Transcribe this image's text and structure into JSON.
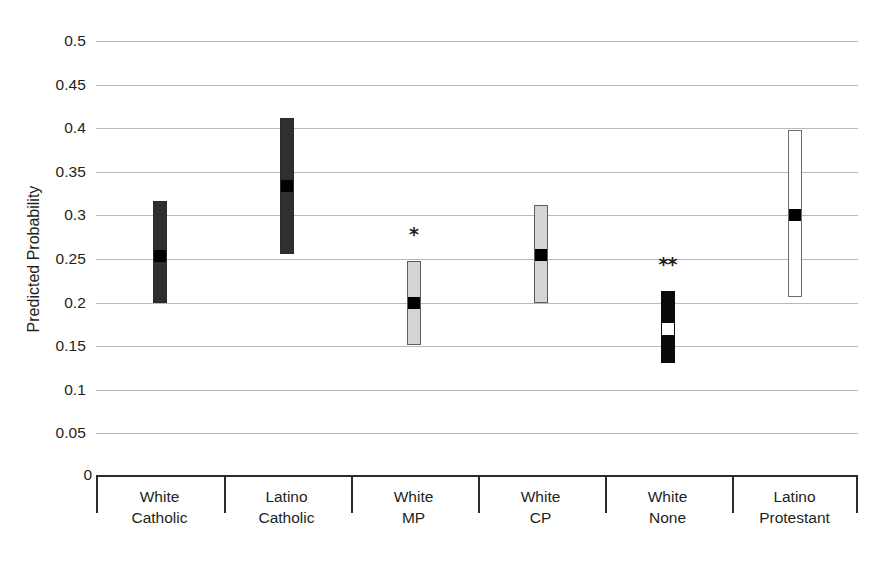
{
  "chart_data": {
    "type": "bar",
    "title": "",
    "xlabel": "",
    "ylabel": "Predicted Probability",
    "ylim": [
      0,
      0.5
    ],
    "ytick_values": [
      0.5,
      0.45,
      0.4,
      0.35,
      0.3,
      0.25,
      0.2,
      0.15,
      0.1,
      0.05,
      0
    ],
    "ytick_labels": [
      "0.5",
      "0.45",
      "0.4",
      "0.35",
      "0.3",
      "0.25",
      "0.2",
      "0.15",
      "0.1",
      "0.05",
      "0"
    ],
    "grid": true,
    "legend_position": "none",
    "categories": [
      "White Catholic",
      "Latino Catholic",
      "White MP",
      "White CP",
      "White None",
      "Latino Protestant"
    ],
    "category_labels": [
      [
        "White",
        "Catholic"
      ],
      [
        "Latino",
        "Catholic"
      ],
      [
        "White",
        "MP"
      ],
      [
        "White",
        "CP"
      ],
      [
        "White",
        "None"
      ],
      [
        "Latino",
        "Protestant"
      ]
    ],
    "series": [
      {
        "name": "Predicted probability (point estimate)",
        "values": [
          0.254,
          0.334,
          0.2,
          0.255,
          0.17,
          0.301
        ]
      },
      {
        "name": "Confidence interval lower bound",
        "values": [
          0.199,
          0.256,
          0.151,
          0.2,
          0.131,
          0.206
        ]
      },
      {
        "name": "Confidence interval upper bound",
        "values": [
          0.316,
          0.412,
          0.248,
          0.312,
          0.213,
          0.398
        ]
      }
    ],
    "bar_styles": [
      "fill-darkgray",
      "fill-darkgray",
      "fill-lightgray",
      "fill-lightgray",
      "fill-black",
      "fill-white"
    ],
    "marker_styles": [
      "marker-black",
      "marker-black",
      "marker-black",
      "marker-black",
      "marker-white",
      "marker-black"
    ],
    "annotations": [
      {
        "category": "White MP",
        "text": "*",
        "value": 0.278
      },
      {
        "category": "White None",
        "text": "**",
        "value": 0.243
      }
    ],
    "colors": {
      "dark_gray_fill": "#2f2f2f",
      "light_gray_fill": "#d4d4d4",
      "black_fill": "#0a0a0a",
      "white_fill": "#ffffff",
      "gridline": "#b9b9b9",
      "axis": "#2b2b2b",
      "text": "#231f20"
    }
  }
}
